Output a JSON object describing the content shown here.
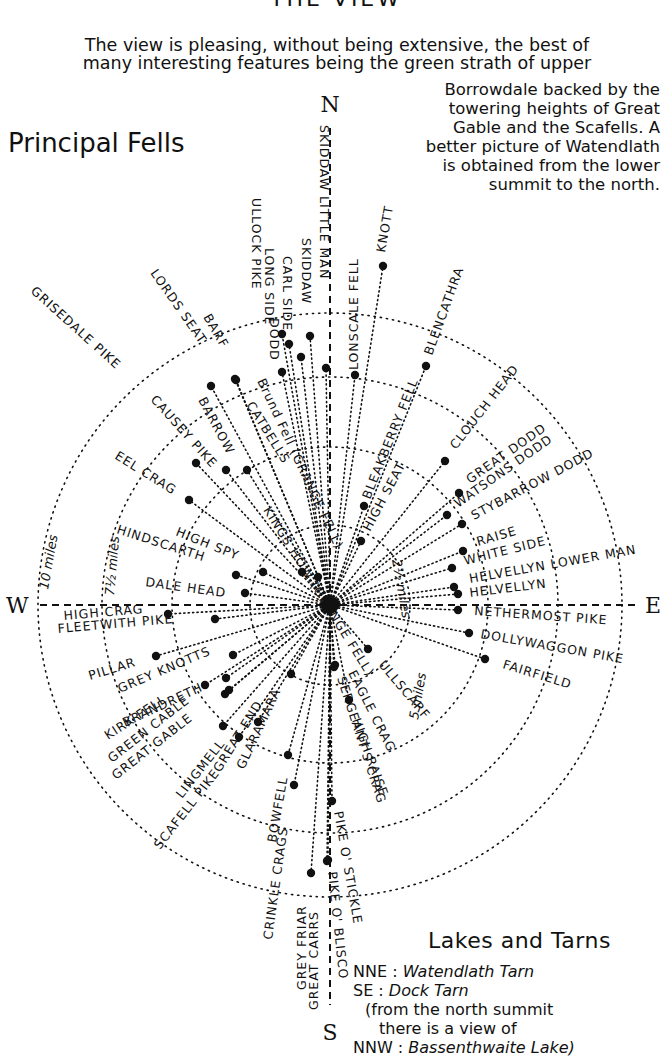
{
  "header": {
    "title": "THE VIEW",
    "intro_line1": "The view is pleasing, without being extensive, the best of",
    "intro_line2": "many interesting features being the green strath of upper",
    "side_note": [
      "Borrowdale backed by the",
      "towering heights of Great",
      "Gable and the Scafells.  A",
      "better picture of Watendlath",
      "is obtained from the lower",
      "summit to the north."
    ]
  },
  "principal_fells_title": "Principal Fells",
  "diagram": {
    "center": [
      330,
      605
    ],
    "compass": {
      "N": "N",
      "E": "E",
      "S": "S",
      "W": "W"
    },
    "rings": [
      {
        "label": "2½ miles",
        "radius": 80
      },
      {
        "label": "5 miles",
        "radius": 158
      },
      {
        "label": "7½ miles",
        "radius": 228
      },
      {
        "label": "10 miles",
        "radius": 292
      }
    ],
    "fells": [
      {
        "name": "SKIDDAW LITTLE MAN",
        "dot": [
          326,
          368
        ],
        "lx": 320,
        "ly": 125,
        "rot": 90
      },
      {
        "name": "SKIDDAW",
        "dot": [
          310,
          336
        ],
        "lx": 302,
        "ly": 238,
        "rot": 90
      },
      {
        "name": "CARL SIDE",
        "dot": [
          289,
          344
        ],
        "lx": 283,
        "ly": 256,
        "rot": 90
      },
      {
        "name": "LONG SIDE",
        "dot": [
          282,
          334
        ],
        "lx": 265,
        "ly": 248,
        "rot": 90
      },
      {
        "name": "ULLOCK PIKE",
        "dot": [
          282,
          372
        ],
        "lx": 252,
        "ly": 198,
        "rot": 90
      },
      {
        "name": "DODD",
        "dot": [
          301,
          357
        ],
        "lx": 270,
        "ly": 318,
        "rot": 90
      },
      {
        "name": "LONSCALE FELL",
        "dot": [
          355,
          375
        ],
        "lx": 358,
        "ly": 370,
        "rot": -90
      },
      {
        "name": "KNOTT",
        "dot": [
          383,
          266
        ],
        "lx": 385,
        "ly": 253,
        "rot": -80
      },
      {
        "name": "BLENCATHRA",
        "dot": [
          426,
          366
        ],
        "lx": 432,
        "ly": 356,
        "rot": -70
      },
      {
        "name": "BLEAKBERRY FELL",
        "dot": [
          364,
          506
        ],
        "lx": 370,
        "ly": 500,
        "rot": -68
      },
      {
        "name": "HIGH SEAT",
        "dot": [
          361,
          541
        ],
        "lx": 370,
        "ly": 532,
        "rot": -62
      },
      {
        "name": "CLOUCH HEAD",
        "dot": [
          445,
          461
        ],
        "lx": 456,
        "ly": 450,
        "rot": -52
      },
      {
        "name": "GREAT DODD",
        "dot": [
          459,
          493
        ],
        "lx": 470,
        "ly": 484,
        "rot": -35
      },
      {
        "name": "WATSONS DODD",
        "dot": [
          447,
          515
        ],
        "lx": 458,
        "ly": 508,
        "rot": -35
      },
      {
        "name": "STYBARROW DODD",
        "dot": [
          462,
          524
        ],
        "lx": 474,
        "ly": 520,
        "rot": -28
      },
      {
        "name": "RAISE",
        "dot": [
          463,
          551
        ],
        "lx": 478,
        "ly": 546,
        "rot": -16
      },
      {
        "name": "WHITE SIDE",
        "dot": [
          452,
          568
        ],
        "lx": 465,
        "ly": 565,
        "rot": -14
      },
      {
        "name": "HELVELLYN LOWER MAN",
        "dot": [
          454,
          587
        ],
        "lx": 470,
        "ly": 583,
        "rot": -10
      },
      {
        "name": "HELVELLYN",
        "dot": [
          458,
          594
        ],
        "lx": 470,
        "ly": 597,
        "rot": -7
      },
      {
        "name": "NETHERMOST PIKE",
        "dot": [
          458,
          610
        ],
        "lx": 474,
        "ly": 615,
        "rot": 4
      },
      {
        "name": "DOLLYWAGGON PIKE",
        "dot": [
          469,
          633
        ],
        "lx": 480,
        "ly": 638,
        "rot": 10
      },
      {
        "name": "FAIRFIELD",
        "dot": [
          485,
          659
        ],
        "lx": 502,
        "ly": 668,
        "rot": 17
      },
      {
        "name": "ULLSCARF",
        "dot": [
          368,
          649
        ],
        "lx": 378,
        "ly": 665,
        "rot": 50
      },
      {
        "name": "EAGLE CRAG",
        "dot": [
          349,
          700
        ],
        "lx": 348,
        "ly": 673,
        "rot": 63
      },
      {
        "name": "HIGH RAISE",
        "dot": [
          335,
          665
        ],
        "lx": 352,
        "ly": 720,
        "rot": 70
      },
      {
        "name": "SERGEANT'S CRAG",
        "dot": [
          334,
          667
        ],
        "lx": 337,
        "ly": 678,
        "rot": 72
      },
      {
        "name": "PIKE O' STICKLE",
        "dot": [
          332,
          801
        ],
        "lx": 334,
        "ly": 812,
        "rot": 80
      },
      {
        "name": "PIKE O' BLISCO",
        "dot": [
          328,
          860
        ],
        "lx": 328,
        "ly": 872,
        "rot": 84
      },
      {
        "name": "GREAT CARRS",
        "dot": [
          327,
          861
        ],
        "lx": 318,
        "ly": 1010,
        "rot": -90
      },
      {
        "name": "GREY FRIAR",
        "dot": [
          311,
          873
        ],
        "lx": 306,
        "ly": 990,
        "rot": -90
      },
      {
        "name": "CRINKLE CRAGS",
        "dot": [
          294,
          785
        ],
        "lx": 272,
        "ly": 940,
        "rot": -82
      },
      {
        "name": "BOWFELL",
        "dot": [
          288,
          755
        ],
        "lx": 276,
        "ly": 843,
        "rot": -80
      },
      {
        "name": "GLARAMARA",
        "dot": [
          291,
          674
        ],
        "lx": 244,
        "ly": 770,
        "rot": -65
      },
      {
        "name": "GREAT END",
        "dot": [
          258,
          722
        ],
        "lx": 220,
        "ly": 773,
        "rot": -58
      },
      {
        "name": "SCAFELL PIKE",
        "dot": [
          239,
          737
        ],
        "lx": 160,
        "ly": 850,
        "rot": -52
      },
      {
        "name": "LINGMELL",
        "dot": [
          223,
          726
        ],
        "lx": 182,
        "ly": 799,
        "rot": -52
      },
      {
        "name": "GREAT GABLE",
        "dot": [
          225,
          694
        ],
        "lx": 116,
        "ly": 780,
        "rot": -38
      },
      {
        "name": "GREEN CABLE",
        "dot": [
          229,
          690
        ],
        "lx": 112,
        "ly": 763,
        "rot": -38
      },
      {
        "name": "KIRK FELL",
        "dot": [
          226,
          678
        ],
        "lx": 108,
        "ly": 740,
        "rot": -33
      },
      {
        "name": "BRANDRETH",
        "dot": [
          205,
          685
        ],
        "lx": 125,
        "ly": 727,
        "rot": -25
      },
      {
        "name": "GREY KNOTTS",
        "dot": [
          233,
          655
        ],
        "lx": 120,
        "ly": 693,
        "rot": -23
      },
      {
        "name": "PILLAR",
        "dot": [
          156,
          656
        ],
        "lx": 90,
        "ly": 680,
        "rot": -17
      },
      {
        "name": "FLEETWITH PIKE",
        "dot": [
          215,
          619
        ],
        "lx": 58,
        "ly": 633,
        "rot": -5
      },
      {
        "name": "HIGH CRAG",
        "dot": [
          168,
          614
        ],
        "lx": 64,
        "ly": 620,
        "rot": -5
      },
      {
        "name": "DALE HEAD",
        "dot": [
          245,
          593
        ],
        "lx": 145,
        "ly": 586,
        "rot": 8
      },
      {
        "name": "HINDSCARTH",
        "dot": [
          236,
          575
        ],
        "lx": 116,
        "ly": 533,
        "rot": 18
      },
      {
        "name": "HIGH SPY",
        "dot": [
          263,
          572
        ],
        "lx": 175,
        "ly": 535,
        "rot": 22
      },
      {
        "name": "EEL CRAG",
        "dot": [
          189,
          500
        ],
        "lx": 114,
        "ly": 458,
        "rot": 32
      },
      {
        "name": "CAUSEY PIKE",
        "dot": [
          196,
          463
        ],
        "lx": 150,
        "ly": 400,
        "rot": 48
      },
      {
        "name": "GRISEDALE PIKE",
        "dot": [
          226,
          470
        ],
        "lx": 30,
        "ly": 292,
        "rot": 42
      },
      {
        "name": "CATBELLS",
        "dot": [
          247,
          470
        ],
        "lx": 246,
        "ly": 405,
        "rot": 58
      },
      {
        "name": "BARROW",
        "dot": [
          211,
          386
        ],
        "lx": 198,
        "ly": 400,
        "rot": 62
      },
      {
        "name": "LORDS SEAT",
        "dot": [
          235,
          379
        ],
        "lx": 150,
        "ly": 273,
        "rot": 55
      },
      {
        "name": "BARF",
        "dot": [
          236,
          380
        ],
        "lx": 203,
        "ly": 317,
        "rot": 60
      },
      {
        "name": "KINGS HOW (GRANGE FELL)",
        "dot": [
          302,
          572
        ],
        "lx": 263,
        "ly": 510,
        "rot": 58
      },
      {
        "name": "Brund Fell (GRANGE FELL)",
        "dot": [
          318,
          577
        ],
        "lx": 257,
        "ly": 381,
        "rot": 65
      }
    ]
  },
  "lakes": {
    "title": "Lakes and Tarns",
    "items": [
      {
        "dir": "NNE :",
        "name": "Watendlath Tarn"
      },
      {
        "dir": "SE :",
        "name": "Dock Tarn"
      }
    ],
    "note_line1": "(from the north summit",
    "note_line2": "there is a view of",
    "note_item": {
      "dir": "NNW :",
      "name": "Bassenthwaite Lake)"
    }
  },
  "colors": {
    "ink": "#111111",
    "paper": "#ffffff"
  }
}
